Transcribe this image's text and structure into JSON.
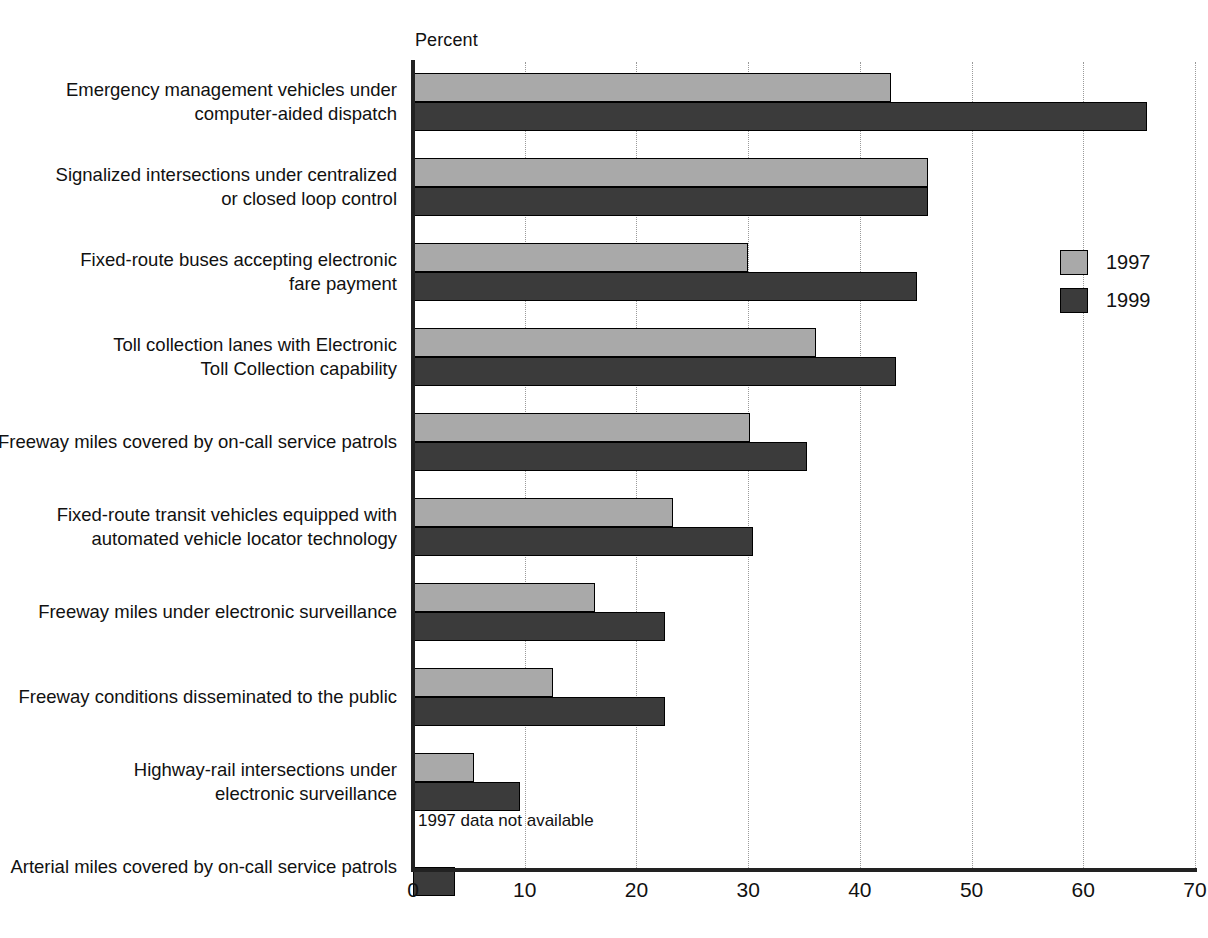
{
  "chart_data": {
    "type": "bar",
    "orientation": "horizontal",
    "title": "",
    "xlabel": "Percent",
    "ylabel": "",
    "xlim": [
      0,
      70
    ],
    "xticks": [
      0,
      10,
      20,
      30,
      40,
      50,
      60,
      70
    ],
    "grid": "vertical dotted gridlines at each x tick",
    "legend_position": "right",
    "categories": [
      "Emergency management vehicles under\ncomputer-aided dispatch",
      "Signalized intersections under centralized\nor closed loop control",
      "Fixed-route buses accepting electronic\nfare payment",
      "Toll collection lanes with Electronic\nToll Collection capability",
      "Freeway miles covered by on-call service patrols",
      "Fixed-route transit vehicles equipped with\nautomated vehicle locator technology",
      "Freeway miles under electronic surveillance",
      "Freeway conditions disseminated to the public",
      "Highway-rail intersections under\nelectronic surveillance",
      "Arterial miles covered by on-call service patrols"
    ],
    "series": [
      {
        "name": "1997",
        "color": "#a9a9a9",
        "values": [
          42.8,
          46.1,
          30.0,
          36.1,
          30.2,
          23.3,
          16.3,
          12.5,
          5.5,
          null
        ]
      },
      {
        "name": "1999",
        "color": "#3b3b3b",
        "values": [
          65.7,
          46.1,
          45.1,
          43.2,
          35.3,
          30.4,
          22.6,
          22.6,
          9.6,
          3.8
        ]
      }
    ],
    "annotations": [
      {
        "text": "1997 data not available",
        "category_index": 9,
        "series": "1997"
      }
    ]
  },
  "legend": {
    "items": [
      {
        "label": "1997",
        "color": "#a9a9a9"
      },
      {
        "label": "1999",
        "color": "#3b3b3b"
      }
    ]
  },
  "axis": {
    "unit_label": "Percent",
    "tick_labels": [
      "0",
      "10",
      "20",
      "30",
      "40",
      "50",
      "60",
      "70"
    ]
  }
}
